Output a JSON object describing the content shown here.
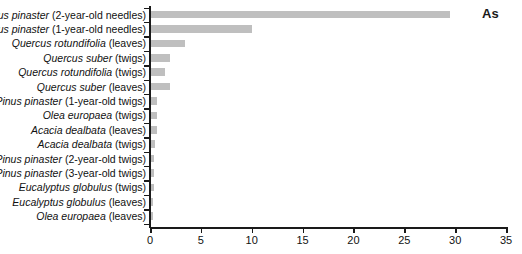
{
  "series_label": "As",
  "colors": {
    "bar": "#bfbfbf",
    "axis": "#1a1a1a",
    "text": "#111111",
    "background": "#ffffff"
  },
  "axis": {
    "x_ticks": [
      "0",
      "5",
      "10",
      "15",
      "20",
      "25",
      "30",
      "35"
    ]
  },
  "chart_data": {
    "type": "bar",
    "orientation": "horizontal",
    "title": "",
    "subtitle": "",
    "xlabel": "",
    "ylabel": "",
    "xlim": [
      0,
      35
    ],
    "xticks": [
      0,
      5,
      10,
      15,
      20,
      25,
      30,
      35
    ],
    "grid": false,
    "legend": [
      "As"
    ],
    "legend_position": "top-right",
    "bar_color": "#bfbfbf",
    "categories": [
      "Pinus pinaster (2-year-old needles)",
      "Pinus pinaster (1-year-old needles)",
      "Quercus rotundifolia (leaves)",
      "Quercus suber (twigs)",
      "Quercus rotundifolia (twigs)",
      "Quercus suber (leaves)",
      "Pinus pinaster (1-year-old twigs)",
      "Olea europaea (twigs)",
      "Acacia dealbata (leaves)",
      "Acacia dealbata (twigs)",
      "Pinus pinaster (2-year-old twigs)",
      "Pinus pinaster (3-year-old twigs)",
      "Eucalyptus globulus (twigs)",
      "Eucalyptus globulus (leaves)",
      "Olea europaea (leaves)"
    ],
    "values": [
      29.5,
      10.0,
      3.4,
      2.0,
      1.5,
      2.0,
      0.65,
      0.65,
      0.65,
      0.45,
      0.4,
      0.4,
      0.35,
      0.3,
      0.25
    ],
    "series": [
      {
        "name": "As",
        "values": [
          29.5,
          10.0,
          3.4,
          2.0,
          1.5,
          2.0,
          0.65,
          0.65,
          0.65,
          0.45,
          0.4,
          0.4,
          0.35,
          0.3,
          0.25
        ]
      }
    ],
    "category_parts": [
      {
        "italic": "Pinus pinaster",
        "plain": " (2-year-old needles)"
      },
      {
        "italic": "Pinus pinaster",
        "plain": " (1-year-old needles)"
      },
      {
        "italic": "Quercus rotundifolia",
        "plain": " (leaves)"
      },
      {
        "italic": "Quercus suber",
        "plain": " (twigs)"
      },
      {
        "italic": "Quercus rotundifolia",
        "plain": " (twigs)"
      },
      {
        "italic": "Quercus suber",
        "plain": " (leaves)"
      },
      {
        "italic": "Pinus pinaster",
        "plain": " (1-year-old twigs)"
      },
      {
        "italic": "Olea europaea",
        "plain": " (twigs)"
      },
      {
        "italic": "Acacia dealbata",
        "plain": " (leaves)"
      },
      {
        "italic": "Acacia dealbata",
        "plain": " (twigs)"
      },
      {
        "italic": "Pinus pinaster",
        "plain": " (2-year-old twigs)"
      },
      {
        "italic": "Pinus pinaster",
        "plain": " (3-year-old twigs)"
      },
      {
        "italic": "Eucalyptus globulus",
        "plain": " (twigs)"
      },
      {
        "italic": "Eucalyptus globulus",
        "plain": " (leaves)"
      },
      {
        "italic": "Olea europaea",
        "plain": " (leaves)"
      }
    ]
  }
}
